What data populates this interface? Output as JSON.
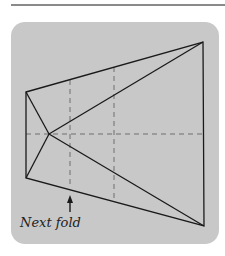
{
  "figure": {
    "caption": "Next fold",
    "colors": {
      "background": "#ffffff",
      "card": "#c8c8c8",
      "rule": "#8a8a8a",
      "line": "#1a1a1a",
      "dashed": "#6e6e6e"
    },
    "vertices": {
      "top_left": [
        26,
        92
      ],
      "bottom_left": [
        26,
        178
      ],
      "top_right": [
        203,
        42
      ],
      "bottom_right": [
        204,
        226
      ],
      "center": [
        49,
        134
      ]
    },
    "fold_lines_dashed": [
      {
        "name": "vertical-fold-1",
        "x": 70,
        "y1": 80,
        "y2": 188
      },
      {
        "name": "vertical-fold-2",
        "x": 114,
        "y1": 67,
        "y2": 200
      },
      {
        "name": "horizontal-fold",
        "y": 134,
        "x1": 26,
        "x2": 203
      }
    ],
    "arrow": {
      "x": 70,
      "tip_y": 196,
      "tail_y": 212,
      "label": "Next fold"
    }
  }
}
